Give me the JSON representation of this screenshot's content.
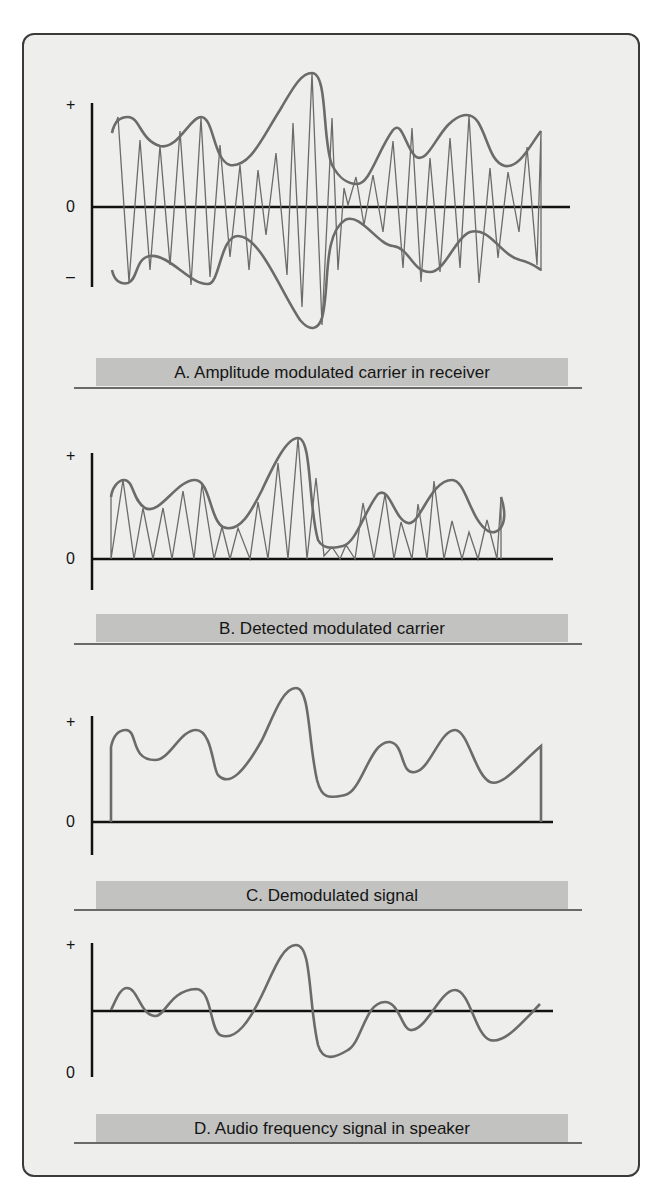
{
  "panels": [
    {
      "id": "A",
      "caption": "A. Amplitude modulated carrier in receiver",
      "axis_labels": {
        "plus": "+",
        "zero": "0",
        "minus": "–"
      }
    },
    {
      "id": "B",
      "caption": "B. Detected modulated carrier",
      "axis_labels": {
        "plus": "+",
        "zero": "0"
      }
    },
    {
      "id": "C",
      "caption": "C. Demodulated signal",
      "axis_labels": {
        "plus": "+",
        "zero": "0"
      }
    },
    {
      "id": "D",
      "caption": "D. Audio frequency signal in speaker",
      "axis_labels": {
        "plus": "+",
        "zero": "0"
      }
    }
  ],
  "colors": {
    "background": "#eeeeec",
    "caption_bar": "#c2c2c0",
    "waveform": "#6b6b6b",
    "axis": "#111111",
    "frame": "#3a3a3a"
  }
}
